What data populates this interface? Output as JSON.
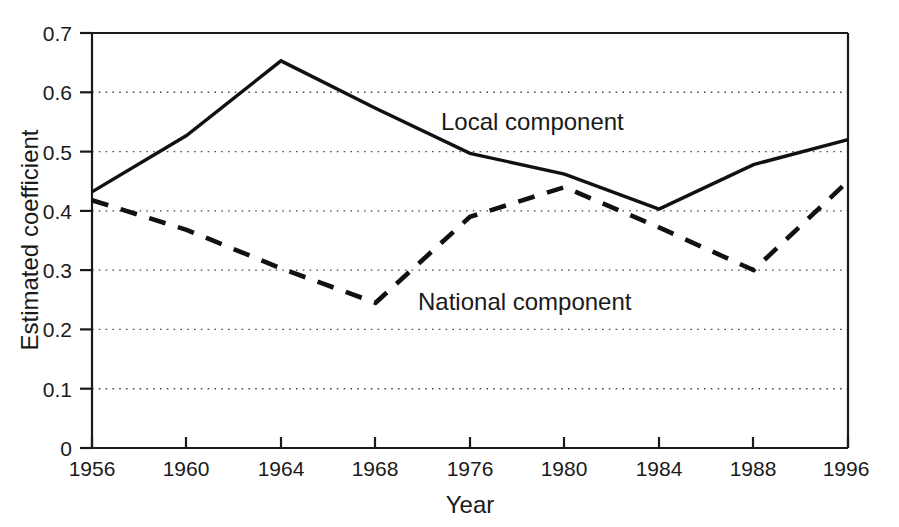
{
  "chart_data": {
    "type": "line",
    "title": "",
    "xlabel": "Year",
    "ylabel": "Estimated coefficient",
    "x": [
      "1956",
      "1960",
      "1964",
      "1968",
      "1976",
      "1980",
      "1984",
      "1988",
      "1996"
    ],
    "categories": [
      "1956",
      "1960",
      "1964",
      "1968",
      "1976",
      "1980",
      "1984",
      "1988",
      "1996"
    ],
    "xtick_labels": [
      "1956",
      "1960",
      "1964",
      "1968",
      "1976",
      "1980",
      "1984",
      "1988",
      "1996"
    ],
    "ytick_labels": [
      "0",
      "0.1",
      "0.2",
      "0.3",
      "0.4",
      "0.5",
      "0.6",
      "0.7"
    ],
    "ytick_values": [
      0,
      0.1,
      0.2,
      0.3,
      0.4,
      0.5,
      0.6,
      0.7
    ],
    "ylim": [
      0,
      0.7
    ],
    "grid": "horizontal-dotted",
    "legend_position": "inline-annotations",
    "series": [
      {
        "name": "Local component",
        "style": "solid",
        "color": "#111111",
        "values": [
          0.432,
          0.527,
          0.653,
          0.573,
          0.497,
          0.462,
          0.403,
          0.478,
          0.52
        ]
      },
      {
        "name": "National component",
        "style": "dashed",
        "color": "#111111",
        "values": [
          0.418,
          0.368,
          0.303,
          0.245,
          0.39,
          0.44,
          0.372,
          0.3,
          0.45
        ]
      }
    ],
    "annotations": [
      {
        "text": "Local component",
        "x": "1976",
        "y": 0.575
      },
      {
        "text": "National component",
        "x": "1976",
        "y": 0.268
      }
    ]
  },
  "axes": {
    "x_title": "Year",
    "y_title": "Estimated coefficient"
  }
}
